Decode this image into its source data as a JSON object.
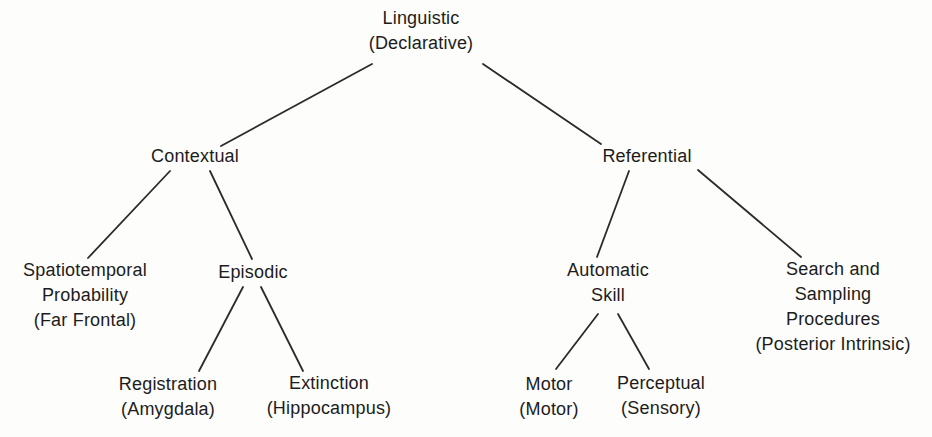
{
  "diagram": {
    "background_color": "#fdfdfb",
    "text_color": "#1c1c1c",
    "line_color": "#2b2b2b",
    "nodes": {
      "linguistic": {
        "lines": [
          "Linguistic",
          "(Declarative)"
        ]
      },
      "contextual": {
        "lines": [
          "Contextual"
        ]
      },
      "referential": {
        "lines": [
          "Referential"
        ]
      },
      "spatiotemporal": {
        "lines": [
          "Spatiotemporal",
          "Probability",
          "(Far Frontal)"
        ]
      },
      "episodic": {
        "lines": [
          "Episodic"
        ]
      },
      "registration": {
        "lines": [
          "Registration",
          "(Amygdala)"
        ]
      },
      "extinction": {
        "lines": [
          "Extinction",
          "(Hippocampus)"
        ]
      },
      "automatic_skill": {
        "lines": [
          "Automatic",
          "Skill"
        ]
      },
      "search_sampling": {
        "lines": [
          "Search and",
          "Sampling",
          "Procedures",
          "(Posterior Intrinsic)"
        ]
      },
      "motor": {
        "lines": [
          "Motor",
          "(Motor)"
        ]
      },
      "perceptual": {
        "lines": [
          "Perceptual",
          "(Sensory)"
        ]
      }
    },
    "edges": [
      {
        "from": "linguistic",
        "to": "contextual"
      },
      {
        "from": "linguistic",
        "to": "referential"
      },
      {
        "from": "contextual",
        "to": "spatiotemporal"
      },
      {
        "from": "contextual",
        "to": "episodic"
      },
      {
        "from": "episodic",
        "to": "registration"
      },
      {
        "from": "episodic",
        "to": "extinction"
      },
      {
        "from": "referential",
        "to": "automatic_skill"
      },
      {
        "from": "referential",
        "to": "search_sampling"
      },
      {
        "from": "automatic_skill",
        "to": "motor"
      },
      {
        "from": "automatic_skill",
        "to": "perceptual"
      }
    ]
  }
}
